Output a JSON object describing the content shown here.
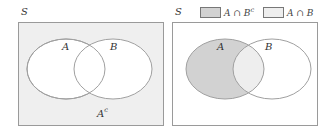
{
  "left_diagram": {
    "universe_label": "S",
    "set_a_label": "A",
    "set_b_label": "B",
    "complement_label": "A",
    "complement_sup": "c",
    "background_color": "#efefef",
    "ellipse_fill": "#ffffff",
    "stroke_color": "#9a9a9a"
  },
  "right_diagram": {
    "universe_label": "S",
    "set_a_label": "A",
    "set_b_label": "B",
    "legend": [
      {
        "label": "A ∩ B",
        "sup": "c",
        "color": "#d2d2d2"
      },
      {
        "label": "A ∩ B",
        "sup": "",
        "color": "#eeeeee"
      }
    ],
    "a_only_fill": "#d2d2d2",
    "intersection_fill": "#eeeeee",
    "stroke_color": "#9a9a9a"
  }
}
